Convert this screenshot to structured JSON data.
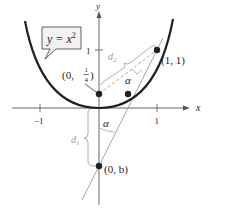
{
  "diagram": {
    "curve": {
      "equation_label_main": "y = x",
      "equation_label_exp": "2",
      "color": "#231f20"
    },
    "axes": {
      "x_label": "x",
      "y_label": "y",
      "x_ticks": [
        {
          "value": -1,
          "label": "−1"
        },
        {
          "value": 1,
          "label": "1"
        }
      ],
      "y_ticks": [
        {
          "value": 1,
          "label": "1"
        }
      ],
      "color": "#555555"
    },
    "points": {
      "focus": {
        "label_prefix": "(0, ",
        "label_num": "1",
        "label_den": "4",
        "label_suffix": ")"
      },
      "tangent_point": {
        "label": "(1, 1)"
      },
      "y_intercept": {
        "label": "(0, b)"
      }
    },
    "distances": {
      "d1": {
        "label": "d",
        "sub": "1"
      },
      "d2": {
        "label": "d",
        "sub": "2"
      }
    },
    "angles": {
      "alpha_upper": "α",
      "alpha_lower": "α"
    },
    "colors": {
      "ink": "#231f20",
      "guide": "#9a9a9a",
      "callout_fill": "#f2f2f2"
    }
  }
}
